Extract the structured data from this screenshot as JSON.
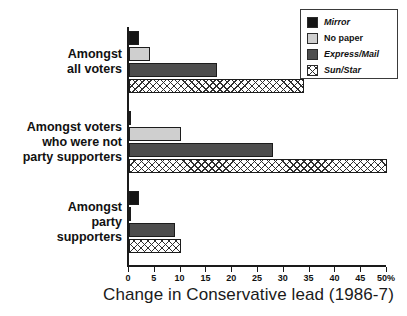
{
  "chart_data": {
    "type": "bar",
    "orientation": "horizontal",
    "title": "",
    "xlabel": "Change in Conservative lead (1986-7)",
    "ylabel": "",
    "xlim": [
      0,
      50
    ],
    "xticks": [
      0,
      5,
      10,
      15,
      20,
      25,
      30,
      35,
      40,
      45,
      50
    ],
    "xtick_labels": [
      "0",
      "5",
      "10",
      "15",
      "20",
      "25",
      "30",
      "35",
      "40",
      "45",
      "50%"
    ],
    "grid": false,
    "legend_position": "top-right",
    "categories": [
      "Amongst all voters",
      "Amongst voters who were not party supporters",
      "Amongst party supporters"
    ],
    "category_lines": [
      [
        "Amongst",
        "all voters"
      ],
      [
        "Amongst voters",
        "who were not",
        "party supporters"
      ],
      [
        "Amongst",
        "party",
        "supporters"
      ]
    ],
    "series": [
      {
        "name": "Mirror",
        "values": [
          2,
          0.3,
          2
        ],
        "color": "#141414",
        "pattern": "solid",
        "italic": true
      },
      {
        "name": "No paper",
        "values": [
          4,
          10,
          0.3
        ],
        "color": "#cfcfcf",
        "pattern": "solid",
        "italic": false
      },
      {
        "name": "Express/Mail",
        "values": [
          17,
          28,
          9
        ],
        "color": "#4e4e4e",
        "pattern": "solid",
        "italic": true
      },
      {
        "name": "Sun/Star",
        "values": [
          34,
          50,
          10
        ],
        "color": "#ffffff",
        "pattern": "crosshatch",
        "italic": true
      }
    ]
  },
  "legend": {
    "items": [
      {
        "label": "Mirror"
      },
      {
        "label": "No paper"
      },
      {
        "label": "Express/Mail"
      },
      {
        "label": "Sun/Star"
      }
    ]
  },
  "axis": {
    "x_title": "Change in Conservative lead (1986-7)"
  }
}
